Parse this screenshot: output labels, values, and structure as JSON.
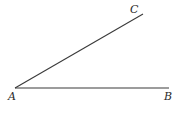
{
  "diagram": {
    "type": "angle",
    "points": {
      "A": {
        "label": "A",
        "x": 15,
        "y": 88
      },
      "B": {
        "label": "B",
        "x": 169,
        "y": 88
      },
      "C": {
        "label": "C",
        "x": 143,
        "y": 14
      }
    },
    "segments": [
      {
        "from": "A",
        "to": "B"
      },
      {
        "from": "A",
        "to": "C"
      }
    ],
    "line_color": "#3a3a3a"
  }
}
